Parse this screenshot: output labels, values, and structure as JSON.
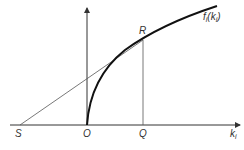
{
  "diagram": {
    "curve_label": "f",
    "curve_label_sub": "i",
    "curve_label_arg": "(k",
    "curve_label_arg_sub": "i",
    "curve_label_close": ")",
    "x_axis_label": "k",
    "x_axis_label_sub": "i",
    "points": {
      "S": "S",
      "O": "O",
      "Q": "Q",
      "R": "R"
    },
    "colors": {
      "curve": "#111111",
      "axis": "#333333",
      "line": "#555555",
      "background": "#ffffff"
    }
  }
}
